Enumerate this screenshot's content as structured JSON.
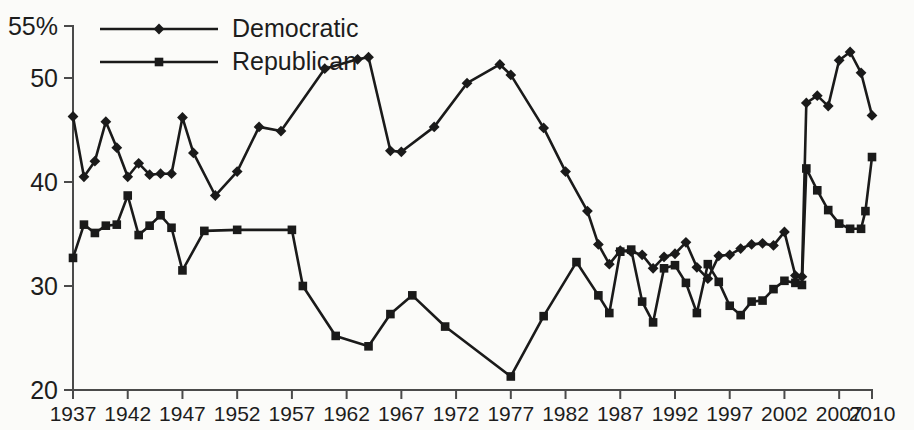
{
  "chart_data": {
    "type": "line",
    "title": "",
    "subtitle": "",
    "xlabel": "",
    "ylabel": "",
    "xlim": [
      1937,
      2010
    ],
    "ylim": [
      20,
      55
    ],
    "grid": false,
    "legend_position": "top-left",
    "y_ticks": [
      20,
      30,
      40,
      50,
      55
    ],
    "y_tick_labels": [
      "20",
      "30",
      "40",
      "50",
      "55%"
    ],
    "x_ticks": [
      1937,
      1942,
      1947,
      1952,
      1957,
      1962,
      1967,
      1972,
      1977,
      1982,
      1987,
      1992,
      1997,
      2002,
      2007,
      2010
    ],
    "x_tick_labels": [
      "1937",
      "1942",
      "1947",
      "1952",
      "1957",
      "1962",
      "1967",
      "1972",
      "1977",
      "1982",
      "1987",
      "1992",
      "1997",
      "2002",
      "2007",
      "2010"
    ],
    "series": [
      {
        "name": "Democratic",
        "marker": "diamond",
        "color": "#1a1a1a",
        "points": [
          [
            1937,
            46.3
          ],
          [
            1938,
            40.5
          ],
          [
            1939,
            42.0
          ],
          [
            1940,
            45.8
          ],
          [
            1941,
            43.3
          ],
          [
            1942,
            40.5
          ],
          [
            1943,
            41.8
          ],
          [
            1944,
            40.7
          ],
          [
            1945,
            40.8
          ],
          [
            1946,
            40.8
          ],
          [
            1947,
            46.2
          ],
          [
            1948,
            42.8
          ],
          [
            1950,
            38.7
          ],
          [
            1952,
            41.0
          ],
          [
            1954,
            45.3
          ],
          [
            1956,
            44.9
          ],
          [
            1960,
            50.9
          ],
          [
            1963,
            51.8
          ],
          [
            1964,
            52.0
          ],
          [
            1966,
            43.0
          ],
          [
            1967,
            42.9
          ],
          [
            1970,
            45.3
          ],
          [
            1973,
            49.5
          ],
          [
            1976,
            51.3
          ],
          [
            1977,
            50.3
          ],
          [
            1980,
            45.2
          ],
          [
            1982,
            41.0
          ],
          [
            1984,
            37.2
          ],
          [
            1985,
            34.0
          ],
          [
            1986,
            32.1
          ],
          [
            1987,
            33.4
          ],
          [
            1988,
            33.3
          ],
          [
            1989,
            33.0
          ],
          [
            1990,
            31.7
          ],
          [
            1991,
            32.8
          ],
          [
            1992,
            33.1
          ],
          [
            1993,
            34.2
          ],
          [
            1994,
            31.8
          ],
          [
            1995,
            30.7
          ],
          [
            1996,
            32.9
          ],
          [
            1997,
            33.0
          ],
          [
            1998,
            33.6
          ],
          [
            1999,
            34.0
          ],
          [
            2000,
            34.1
          ],
          [
            2001,
            33.9
          ],
          [
            2002,
            35.2
          ],
          [
            2003,
            31.0
          ],
          [
            2003.6,
            30.9
          ],
          [
            2004,
            47.6
          ],
          [
            2005,
            48.3
          ],
          [
            2006,
            47.3
          ],
          [
            2007,
            51.7
          ],
          [
            2008,
            52.5
          ],
          [
            2009,
            50.5
          ],
          [
            2010,
            46.4
          ]
        ]
      },
      {
        "name": "Republican",
        "marker": "square",
        "color": "#1a1a1a",
        "points": [
          [
            1937,
            32.7
          ],
          [
            1938,
            35.9
          ],
          [
            1939,
            35.1
          ],
          [
            1940,
            35.8
          ],
          [
            1941,
            35.9
          ],
          [
            1942,
            38.7
          ],
          [
            1943,
            34.9
          ],
          [
            1944,
            35.8
          ],
          [
            1945,
            36.8
          ],
          [
            1946,
            35.6
          ],
          [
            1947,
            31.5
          ],
          [
            1949,
            35.3
          ],
          [
            1952,
            35.4
          ],
          [
            1957,
            35.4
          ],
          [
            1958,
            30.0
          ],
          [
            1961,
            25.2
          ],
          [
            1964,
            24.2
          ],
          [
            1966,
            27.3
          ],
          [
            1968,
            29.1
          ],
          [
            1971,
            26.1
          ],
          [
            1977,
            21.3
          ],
          [
            1980,
            27.1
          ],
          [
            1983,
            32.3
          ],
          [
            1985,
            29.1
          ],
          [
            1986,
            27.4
          ],
          [
            1987,
            33.3
          ],
          [
            1988,
            33.5
          ],
          [
            1989,
            28.5
          ],
          [
            1990,
            26.5
          ],
          [
            1991,
            31.7
          ],
          [
            1992,
            32.0
          ],
          [
            1993,
            30.3
          ],
          [
            1994,
            27.4
          ],
          [
            1995,
            32.1
          ],
          [
            1996,
            30.4
          ],
          [
            1997,
            28.1
          ],
          [
            1998,
            27.2
          ],
          [
            1999,
            28.5
          ],
          [
            2000,
            28.6
          ],
          [
            2001,
            29.7
          ],
          [
            2002,
            30.5
          ],
          [
            2003,
            30.3
          ],
          [
            2003.6,
            30.1
          ],
          [
            2004,
            41.3
          ],
          [
            2005,
            39.2
          ],
          [
            2006,
            37.3
          ],
          [
            2007,
            36.0
          ],
          [
            2008,
            35.5
          ],
          [
            2009,
            35.5
          ],
          [
            2009.4,
            37.2
          ],
          [
            2010,
            42.4
          ]
        ]
      }
    ],
    "legend": [
      {
        "label": "Democratic",
        "marker": "diamond"
      },
      {
        "label": "Republican",
        "marker": "square"
      }
    ]
  },
  "accent_color": "#1a1a1a",
  "background_color": "#fbfbf9"
}
